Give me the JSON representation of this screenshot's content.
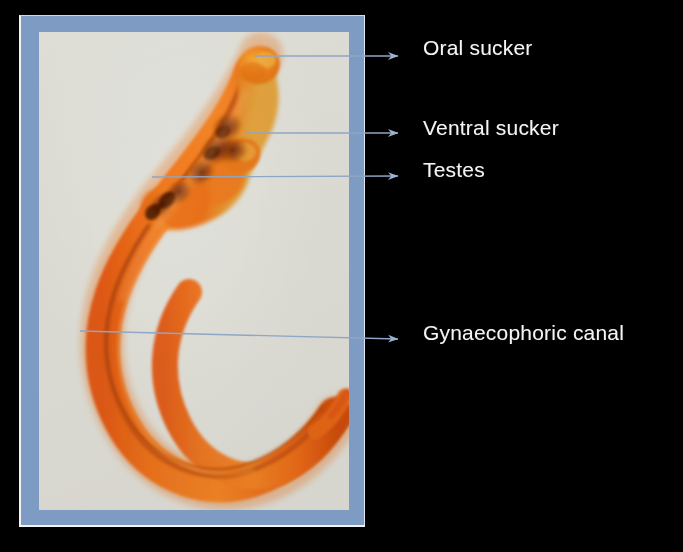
{
  "slide": {
    "background_color": "#000000",
    "frame_color": "#7e9bc4",
    "photo_background_color": "#e7e7e2",
    "leader_line_color": "#8fa6c6",
    "label_text_color": "#f4f4f4",
    "specimen_color": "#f26a1b",
    "specimen_dark_color": "#7a2f0c"
  },
  "labels": [
    {
      "id": "oral-sucker",
      "text": "Oral sucker",
      "leader": {
        "x1": 255,
        "y1": 56,
        "x2": 398,
        "y2": 56
      },
      "arrow_x": 415,
      "arrow_y": 56
    },
    {
      "id": "ventral-sucker",
      "text": "Ventral sucker",
      "leader": {
        "x1": 245,
        "y1": 133,
        "x2": 398,
        "y2": 133
      },
      "arrow_x": 415,
      "arrow_y": 133
    },
    {
      "id": "testes",
      "text": "Testes",
      "leader": {
        "x1": 152,
        "y1": 177,
        "x2": 398,
        "y2": 176
      },
      "arrow_x": 415,
      "arrow_y": 176
    },
    {
      "id": "gynaecophoric-canal",
      "text": "Gynaecophoric canal",
      "leader": {
        "x1": 80,
        "y1": 331,
        "x2": 398,
        "y2": 339
      },
      "arrow_x": 415,
      "arrow_y": 339
    }
  ],
  "specimen": {
    "organism_description": "male schistosome fluke, whole mount, carmine stained",
    "features": [
      "oral sucker",
      "ventral sucker",
      "testes",
      "gynaecophoric canal"
    ]
  }
}
